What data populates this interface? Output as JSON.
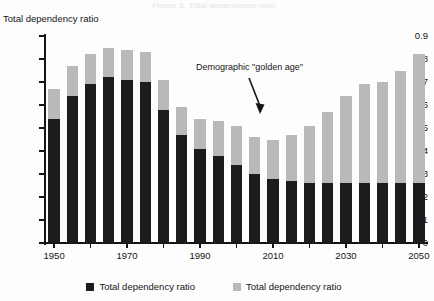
{
  "figure": {
    "cut_off_title": "Figure 3. Total dependency ratio",
    "y_axis_title": "Total dependency ratio"
  },
  "annotation": {
    "text": "Demographic \"golden age\"",
    "arrow_icon": "down-arrow-icon"
  },
  "legend": {
    "position": "bottom-center",
    "items": [
      {
        "label": "Total dependency ratio",
        "color": "#1c1c1c",
        "swatch_icon": "black-square-icon"
      },
      {
        "label": "Total dependency ratio",
        "color": "#b9b9b9",
        "swatch_icon": "gray-square-icon"
      }
    ]
  },
  "chart_data": {
    "type": "bar",
    "stacked": true,
    "title": "Total dependency ratio",
    "xlabel": "",
    "ylabel": "Total dependency ratio",
    "ylim": [
      0,
      0.9
    ],
    "ytick_step": 0.1,
    "ytick_labels": [
      "0",
      "0.1",
      "0.2",
      "0.3",
      "0.4",
      "0.5",
      "0.6",
      "0.7",
      "0.8",
      "0.9"
    ],
    "ytick_values": [
      0,
      0.1,
      0.2,
      0.3,
      0.4,
      0.5,
      0.6,
      0.7,
      0.8,
      0.9
    ],
    "grid": false,
    "categories": [
      1950,
      1955,
      1960,
      1965,
      1970,
      1975,
      1980,
      1985,
      1990,
      1995,
      2000,
      2005,
      2010,
      2015,
      2020,
      2025,
      2030,
      2035,
      2040,
      2045,
      2050
    ],
    "xtick_labels": [
      "1950",
      "1970",
      "1990",
      "2010",
      "2030",
      "2050"
    ],
    "xtick_label_values": [
      1950,
      1970,
      1990,
      2010,
      2030,
      2050
    ],
    "series": [
      {
        "name": "Total dependency ratio",
        "color": "#1c1c1c",
        "values": [
          0.54,
          0.64,
          0.69,
          0.72,
          0.71,
          0.7,
          0.58,
          0.47,
          0.41,
          0.38,
          0.34,
          0.3,
          0.28,
          0.27,
          0.26,
          0.26,
          0.26,
          0.26,
          0.26,
          0.26,
          0.26
        ]
      },
      {
        "name": "Total dependency ratio",
        "color": "#b9b9b9",
        "values": [
          0.13,
          0.13,
          0.13,
          0.13,
          0.13,
          0.13,
          0.13,
          0.12,
          0.13,
          0.15,
          0.17,
          0.16,
          0.17,
          0.2,
          0.25,
          0.31,
          0.38,
          0.43,
          0.44,
          0.49,
          0.56
        ]
      }
    ],
    "totals": [
      0.67,
      0.77,
      0.82,
      0.85,
      0.84,
      0.83,
      0.71,
      0.59,
      0.54,
      0.53,
      0.51,
      0.46,
      0.45,
      0.47,
      0.51,
      0.57,
      0.64,
      0.69,
      0.7,
      0.75,
      0.82
    ]
  }
}
